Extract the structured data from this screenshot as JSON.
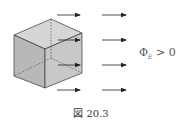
{
  "figure": {
    "caption": "図 20.3",
    "flux_label": {
      "symbol": "Φ",
      "subscript": "E",
      "relation": " > 0"
    },
    "cube": {
      "front_face_color": "#b8b8b8",
      "top_face_color": "#d6d6d6",
      "right_face_color": "#c6c6c6",
      "edge_color": "#333333",
      "hidden_edge_style": "dashed"
    },
    "arrows": {
      "direction": "right",
      "color": "#222222",
      "columns": 2,
      "rows": 4
    }
  }
}
